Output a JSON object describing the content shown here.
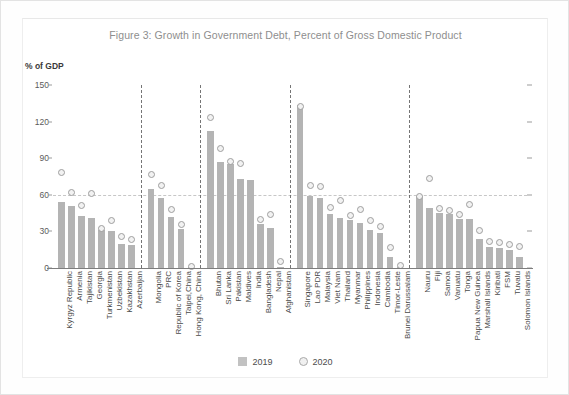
{
  "figure": {
    "title": "Figure 3: Growth in Government Debt, Percent of Gross Domestic Product",
    "axis_unit": "% of GDP"
  },
  "legend": {
    "items": [
      {
        "label": "2019",
        "marker": "square-swatch",
        "color": "#c2c2c2"
      },
      {
        "label": "2020",
        "marker": "circle-outline",
        "color": "#a9a9a9"
      }
    ]
  },
  "chart_data": {
    "type": "bar",
    "title": "Figure 3: Growth in Government Debt, Percent of Gross Domestic Product",
    "xlabel": "",
    "ylabel": "% of GDP",
    "ylim": [
      0,
      150
    ],
    "yticks": [
      0,
      30,
      60,
      90,
      120,
      150
    ],
    "grid": "horizontal dashed gridlines, reference line at 60",
    "legend_position": "bottom-center",
    "series": [
      {
        "name": "2019",
        "type": "bar",
        "color": "#b4b4b4"
      },
      {
        "name": "2020",
        "type": "scatter",
        "color": "#9e9e9e"
      }
    ],
    "groups": [
      {
        "name": "Central and West Asia",
        "categories": [
          "Kyrgyz Republic",
          "Armenia",
          "Tajikistan",
          "Georgia",
          "Turkmenistan",
          "Uzbekistan",
          "Kazakhstan",
          "Azerbaijan"
        ],
        "values_2019": [
          54,
          51,
          43,
          41,
          31,
          30,
          20,
          19
        ],
        "values_2020": [
          78,
          62,
          51,
          61,
          32,
          39,
          26,
          23
        ]
      },
      {
        "name": "East Asia",
        "categories": [
          "Mongolia",
          "PRC",
          "Republic of Korea",
          "Taipei,China",
          "Hong Kong, China"
        ],
        "values_2019": [
          65,
          57,
          42,
          32,
          0.3
        ],
        "values_2020": [
          77,
          68,
          48,
          36,
          1
        ]
      },
      {
        "name": "South Asia",
        "categories": [
          "Bhutan",
          "Sri Lanka",
          "Pakistan",
          "Maldives",
          "India",
          "Bangladesh",
          "Nepal",
          "Afghanistan"
        ],
        "values_2019": [
          112,
          87,
          85,
          73,
          72,
          36,
          33,
          1
        ],
        "values_2020": [
          123,
          98,
          87,
          86,
          0,
          40,
          44,
          5
        ]
      },
      {
        "name": "Southeast Asia",
        "categories": [
          "Singapore",
          "Lao PDR",
          "Malaysia",
          "Viet Nam",
          "Thailand",
          "Myanmar",
          "Philippines",
          "Indonesia",
          "Cambodia",
          "Timor-Leste",
          "Brunei Darussalam"
        ],
        "values_2019": [
          134,
          59,
          57,
          44,
          41,
          39,
          37,
          31,
          29,
          9,
          1
        ],
        "values_2020": [
          132,
          68,
          67,
          50,
          55,
          43,
          48,
          39,
          34,
          17,
          2
        ]
      },
      {
        "name": "The Pacific",
        "categories": [
          "Nauru",
          "Fiji",
          "Samoa",
          "Vanuatu",
          "Tonga",
          "Papua New Guinea",
          "Marshall Islands",
          "Kiribati",
          "FSM",
          "Tuvalu",
          "Solomon Islands"
        ],
        "values_2019": [
          59,
          49,
          45,
          44,
          40,
          40,
          24,
          17,
          16,
          15,
          9
        ],
        "values_2020": [
          59,
          73,
          49,
          47,
          44,
          52,
          31,
          22,
          21,
          19,
          18
        ]
      }
    ]
  }
}
